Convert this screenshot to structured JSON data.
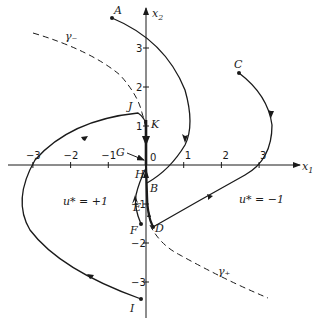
{
  "axes": {
    "x_label": "x",
    "x_sub": "1",
    "y_label": "x",
    "y_sub": "2",
    "x_ticks": [
      {
        "v": -3,
        "label": "−3"
      },
      {
        "v": -2,
        "label": "−2"
      },
      {
        "v": -1,
        "label": "−1"
      },
      {
        "v": 1,
        "label": "1"
      },
      {
        "v": 2,
        "label": "2"
      },
      {
        "v": 3,
        "label": "3"
      }
    ],
    "y_ticks": [
      {
        "v": 3,
        "label": "3"
      },
      {
        "v": 2,
        "label": "2"
      },
      {
        "v": 1,
        "label": "1"
      },
      {
        "v": -1,
        "label": "−1"
      },
      {
        "v": -2,
        "label": "−2"
      },
      {
        "v": -3,
        "label": "−3"
      }
    ],
    "origin_label": "0"
  },
  "switching_curves": {
    "gamma_minus": {
      "label": "γ₋"
    },
    "gamma_plus": {
      "label": "γ₊"
    }
  },
  "regions": {
    "left": "u* = +1",
    "right": "u* = −1"
  },
  "points": [
    {
      "id": "A",
      "label": "A"
    },
    {
      "id": "B",
      "label": "B"
    },
    {
      "id": "C",
      "label": "C"
    },
    {
      "id": "D",
      "label": "D"
    },
    {
      "id": "E",
      "label": "E"
    },
    {
      "id": "F",
      "label": "F"
    },
    {
      "id": "G",
      "label": "G"
    },
    {
      "id": "H",
      "label": "H"
    },
    {
      "id": "I",
      "label": "I"
    },
    {
      "id": "J",
      "label": "J"
    },
    {
      "id": "K",
      "label": "K"
    }
  ],
  "colors": {
    "ink": "#1a1a1a",
    "background": "#ffffff"
  }
}
